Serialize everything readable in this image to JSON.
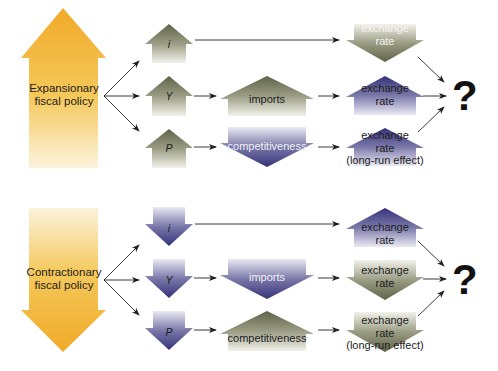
{
  "colors": {
    "orange": "#f0b030",
    "olive": "#6f735a",
    "navy": "#3e3c7a",
    "connector": "#222222"
  },
  "expansionary": {
    "policy_label_line1": "Expansionary",
    "policy_label_line2": "fiscal policy",
    "policy_direction": "up",
    "rows": [
      {
        "variable": "i",
        "variable_direction": "up",
        "mid": null,
        "result_line1": "exchange",
        "result_line2": "rate",
        "result_line3": "",
        "result_direction": "down"
      },
      {
        "variable": "Y",
        "variable_direction": "up",
        "mid": "imports",
        "mid_direction": "up",
        "result_line1": "exchange",
        "result_line2": "rate",
        "result_line3": "",
        "result_direction": "up"
      },
      {
        "variable": "P",
        "variable_direction": "up",
        "mid": "competitiveness",
        "mid_direction": "down",
        "result_line1": "exchange",
        "result_line2": "rate",
        "result_line3": "(long-run effect)",
        "result_direction": "up"
      }
    ],
    "outcome": "?"
  },
  "contractionary": {
    "policy_label_line1": "Contractionary",
    "policy_label_line2": "fiscal policy",
    "policy_direction": "down",
    "rows": [
      {
        "variable": "i",
        "variable_direction": "down",
        "mid": null,
        "result_line1": "exchange",
        "result_line2": "rate",
        "result_line3": "",
        "result_direction": "up"
      },
      {
        "variable": "Y",
        "variable_direction": "down",
        "mid": "imports",
        "mid_direction": "down",
        "result_line1": "exchange",
        "result_line2": "rate",
        "result_line3": "",
        "result_direction": "down"
      },
      {
        "variable": "P",
        "variable_direction": "down",
        "mid": "competitiveness",
        "mid_direction": "up",
        "result_line1": "exchange",
        "result_line2": "rate",
        "result_line3": "(long-run effect)",
        "result_direction": "down"
      }
    ],
    "outcome": "?"
  }
}
